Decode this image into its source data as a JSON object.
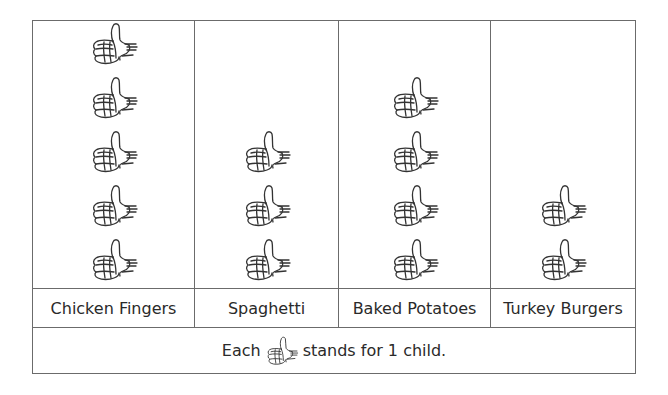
{
  "chart_data": {
    "type": "pictograph",
    "title": "",
    "categories": [
      "Chicken Fingers",
      "Spaghetti",
      "Baked Potatoes",
      "Turkey Burgers"
    ],
    "values": [
      5,
      3,
      4,
      2
    ],
    "symbol": "thumbs-up",
    "key": "Each [thumbs-up] stands for 1 child.",
    "units_per_symbol": 1,
    "unit": "child"
  },
  "legend": {
    "prefix": "Each",
    "suffix": "stands for 1 child."
  },
  "columns": [
    {
      "label": "Chicken Fingers",
      "count": 5,
      "width": 162
    },
    {
      "label": "Spaghetti",
      "count": 3,
      "width": 144
    },
    {
      "label": "Baked Potatoes",
      "count": 4,
      "width": 152
    },
    {
      "label": "Turkey Burgers",
      "count": 2,
      "width": 144
    }
  ],
  "colors": {
    "grid": "#6b6b6b",
    "text": "#2a2a2a",
    "background": "#ffffff"
  }
}
